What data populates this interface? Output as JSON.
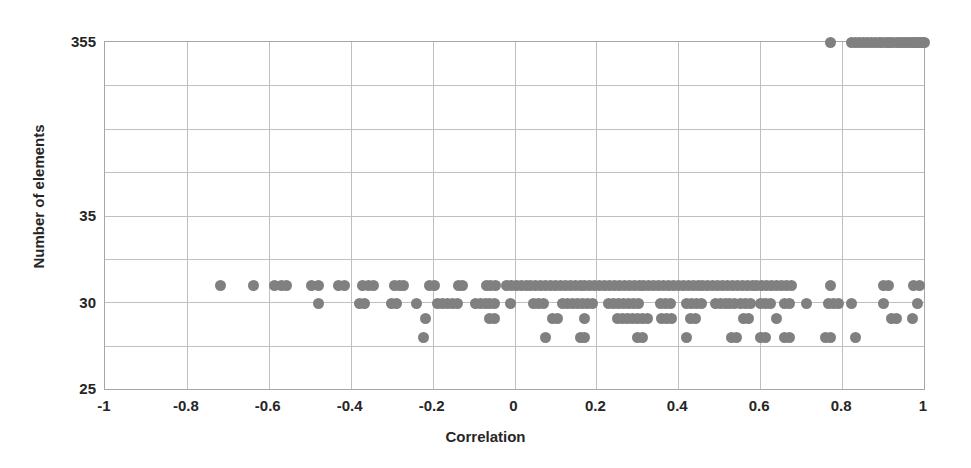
{
  "chart_data": {
    "type": "scatter",
    "title": "",
    "xlabel": "Correlation",
    "ylabel": "Number of elements",
    "xlim": [
      -1,
      1
    ],
    "xticks": [
      "-1",
      "-0.8",
      "-0.6",
      "-0.4",
      "-0.2",
      "0",
      "0.2",
      "0.4",
      "0.6",
      "0.8",
      "1"
    ],
    "xtick_values": [
      -1,
      -0.8,
      -0.6,
      -0.4,
      -0.2,
      0,
      0.2,
      0.4,
      0.6,
      0.8,
      1
    ],
    "yticks": [
      "25",
      "30",
      "35",
      "355"
    ],
    "ytick_values": [
      25,
      30,
      35,
      355
    ],
    "y_axis_note": "non-linear / broken axis: 25, 30, 35 evenly spaced then 355",
    "grid": true,
    "legend": false,
    "marker_color": "#808080",
    "gridline_color": "#bfbfbf",
    "axis_color": "#a6a6a6",
    "text_color": "#262626",
    "y_levels": [
      355,
      31,
      30,
      29.1,
      28
    ],
    "series": [
      {
        "name": "elements vs correlation",
        "points": [
          [
            0.772,
            355
          ],
          [
            0.822,
            355
          ],
          [
            0.832,
            355
          ],
          [
            0.843,
            355
          ],
          [
            0.852,
            355
          ],
          [
            0.861,
            355
          ],
          [
            0.872,
            355
          ],
          [
            0.881,
            355
          ],
          [
            0.89,
            355
          ],
          [
            0.899,
            355
          ],
          [
            0.908,
            355
          ],
          [
            0.916,
            355
          ],
          [
            0.924,
            355
          ],
          [
            0.932,
            355
          ],
          [
            0.94,
            355
          ],
          [
            0.948,
            355
          ],
          [
            0.955,
            355
          ],
          [
            0.962,
            355
          ],
          [
            0.969,
            355
          ],
          [
            0.975,
            355
          ],
          [
            0.981,
            355
          ],
          [
            0.987,
            355
          ],
          [
            0.992,
            355
          ],
          [
            0.996,
            355
          ],
          [
            1.0,
            355
          ],
          [
            -0.718,
            31
          ],
          [
            -0.638,
            31
          ],
          [
            -0.585,
            31
          ],
          [
            -0.568,
            31
          ],
          [
            -0.556,
            31
          ],
          [
            -0.497,
            31
          ],
          [
            -0.478,
            31
          ],
          [
            -0.43,
            31
          ],
          [
            -0.415,
            31
          ],
          [
            -0.371,
            31
          ],
          [
            -0.356,
            31
          ],
          [
            -0.345,
            31
          ],
          [
            -0.294,
            31
          ],
          [
            -0.281,
            31
          ],
          [
            -0.27,
            31
          ],
          [
            -0.208,
            31
          ],
          [
            -0.195,
            31
          ],
          [
            -0.138,
            31
          ],
          [
            -0.126,
            31
          ],
          [
            -0.069,
            31
          ],
          [
            -0.058,
            31
          ],
          [
            -0.046,
            31
          ],
          [
            -0.02,
            31
          ],
          [
            -0.008,
            31
          ],
          [
            0.004,
            31
          ],
          [
            0.016,
            31
          ],
          [
            0.028,
            31
          ],
          [
            0.04,
            31
          ],
          [
            0.052,
            31
          ],
          [
            0.064,
            31
          ],
          [
            0.076,
            31
          ],
          [
            0.088,
            31
          ],
          [
            0.1,
            31
          ],
          [
            0.112,
            31
          ],
          [
            0.124,
            31
          ],
          [
            0.136,
            31
          ],
          [
            0.148,
            31
          ],
          [
            0.16,
            31
          ],
          [
            0.172,
            31
          ],
          [
            0.184,
            31
          ],
          [
            0.196,
            31
          ],
          [
            0.208,
            31
          ],
          [
            0.22,
            31
          ],
          [
            0.232,
            31
          ],
          [
            0.244,
            31
          ],
          [
            0.256,
            31
          ],
          [
            0.268,
            31
          ],
          [
            0.28,
            31
          ],
          [
            0.292,
            31
          ],
          [
            0.304,
            31
          ],
          [
            0.316,
            31
          ],
          [
            0.328,
            31
          ],
          [
            0.34,
            31
          ],
          [
            0.352,
            31
          ],
          [
            0.364,
            31
          ],
          [
            0.376,
            31
          ],
          [
            0.388,
            31
          ],
          [
            0.4,
            31
          ],
          [
            0.412,
            31
          ],
          [
            0.424,
            31
          ],
          [
            0.436,
            31
          ],
          [
            0.448,
            31
          ],
          [
            0.46,
            31
          ],
          [
            0.472,
            31
          ],
          [
            0.484,
            31
          ],
          [
            0.496,
            31
          ],
          [
            0.508,
            31
          ],
          [
            0.52,
            31
          ],
          [
            0.532,
            31
          ],
          [
            0.544,
            31
          ],
          [
            0.556,
            31
          ],
          [
            0.568,
            31
          ],
          [
            0.58,
            31
          ],
          [
            0.592,
            31
          ],
          [
            0.604,
            31
          ],
          [
            0.616,
            31
          ],
          [
            0.628,
            31
          ],
          [
            0.64,
            31
          ],
          [
            0.652,
            31
          ],
          [
            0.664,
            31
          ],
          [
            0.676,
            31
          ],
          [
            0.772,
            31
          ],
          [
            0.9,
            31
          ],
          [
            0.912,
            31
          ],
          [
            0.975,
            31
          ],
          [
            0.99,
            31
          ],
          [
            -0.478,
            30
          ],
          [
            -0.378,
            30
          ],
          [
            -0.366,
            30
          ],
          [
            -0.3,
            30
          ],
          [
            -0.288,
            30
          ],
          [
            -0.24,
            30
          ],
          [
            -0.188,
            30
          ],
          [
            -0.176,
            30
          ],
          [
            -0.164,
            30
          ],
          [
            -0.152,
            30
          ],
          [
            -0.14,
            30
          ],
          [
            -0.096,
            30
          ],
          [
            -0.084,
            30
          ],
          [
            -0.072,
            30
          ],
          [
            -0.06,
            30
          ],
          [
            -0.048,
            30
          ],
          [
            -0.01,
            30
          ],
          [
            0.046,
            30
          ],
          [
            0.058,
            30
          ],
          [
            0.07,
            30
          ],
          [
            0.118,
            30
          ],
          [
            0.13,
            30
          ],
          [
            0.142,
            30
          ],
          [
            0.154,
            30
          ],
          [
            0.166,
            30
          ],
          [
            0.178,
            30
          ],
          [
            0.19,
            30
          ],
          [
            0.23,
            30
          ],
          [
            0.242,
            30
          ],
          [
            0.254,
            30
          ],
          [
            0.266,
            30
          ],
          [
            0.278,
            30
          ],
          [
            0.29,
            30
          ],
          [
            0.302,
            30
          ],
          [
            0.356,
            30
          ],
          [
            0.368,
            30
          ],
          [
            0.38,
            30
          ],
          [
            0.42,
            30
          ],
          [
            0.432,
            30
          ],
          [
            0.444,
            30
          ],
          [
            0.456,
            30
          ],
          [
            0.49,
            30
          ],
          [
            0.502,
            30
          ],
          [
            0.514,
            30
          ],
          [
            0.526,
            30
          ],
          [
            0.538,
            30
          ],
          [
            0.552,
            30
          ],
          [
            0.564,
            30
          ],
          [
            0.576,
            30
          ],
          [
            0.6,
            30
          ],
          [
            0.612,
            30
          ],
          [
            0.624,
            30
          ],
          [
            0.66,
            30
          ],
          [
            0.672,
            30
          ],
          [
            0.712,
            30
          ],
          [
            0.766,
            30
          ],
          [
            0.778,
            30
          ],
          [
            0.79,
            30
          ],
          [
            0.824,
            30
          ],
          [
            0.9,
            30
          ],
          [
            0.984,
            30
          ],
          [
            -0.218,
            29.1
          ],
          [
            -0.062,
            29.1
          ],
          [
            -0.05,
            29.1
          ],
          [
            0.092,
            29.1
          ],
          [
            0.104,
            29.1
          ],
          [
            0.17,
            29.1
          ],
          [
            0.252,
            29.1
          ],
          [
            0.264,
            29.1
          ],
          [
            0.276,
            29.1
          ],
          [
            0.288,
            29.1
          ],
          [
            0.3,
            29.1
          ],
          [
            0.312,
            29.1
          ],
          [
            0.324,
            29.1
          ],
          [
            0.36,
            29.1
          ],
          [
            0.372,
            29.1
          ],
          [
            0.384,
            29.1
          ],
          [
            0.43,
            29.1
          ],
          [
            0.442,
            29.1
          ],
          [
            0.56,
            29.1
          ],
          [
            0.572,
            29.1
          ],
          [
            0.64,
            29.1
          ],
          [
            0.92,
            29.1
          ],
          [
            0.932,
            29.1
          ],
          [
            0.972,
            29.1
          ],
          [
            -0.222,
            28
          ],
          [
            0.075,
            28
          ],
          [
            0.16,
            28
          ],
          [
            0.172,
            28
          ],
          [
            0.3,
            28
          ],
          [
            0.312,
            28
          ],
          [
            0.42,
            28
          ],
          [
            0.53,
            28
          ],
          [
            0.542,
            28
          ],
          [
            0.6,
            28
          ],
          [
            0.612,
            28
          ],
          [
            0.66,
            28
          ],
          [
            0.672,
            28
          ],
          [
            0.76,
            28
          ],
          [
            0.772,
            28
          ],
          [
            0.832,
            28
          ]
        ]
      }
    ]
  }
}
